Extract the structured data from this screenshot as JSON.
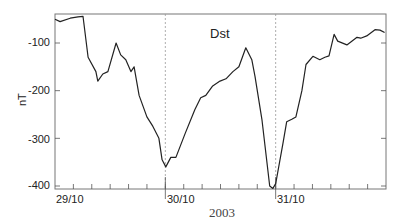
{
  "chart_data": {
    "type": "line",
    "title": "Dst",
    "xlabel": "2003",
    "ylabel": "nT",
    "ylim": [
      -410,
      -40
    ],
    "yticks": [
      -100,
      -200,
      -300,
      -400
    ],
    "ytick_labels": [
      "-100",
      "-200",
      "-300",
      "-400"
    ],
    "xlim_hours": [
      0,
      72
    ],
    "xtick_labels": [
      "29/10",
      "30/10",
      "31/10"
    ],
    "xtick_label_hours": [
      0,
      24,
      48
    ],
    "minor_tick_interval_hours": 4,
    "day_separator_hours": [
      24,
      48
    ],
    "grid": false,
    "legend": null,
    "series": [
      {
        "name": "Dst",
        "color": "#222222",
        "x_hours": [
          0,
          1.1,
          3.3,
          5.0,
          6.1,
          7.2,
          8.9,
          9.3,
          10.4,
          11.5,
          13.3,
          14.3,
          15.4,
          16.5,
          17.2,
          18.3,
          20.0,
          21.3,
          22.6,
          23.3,
          24.1,
          25.2,
          26.3,
          28.3,
          30.4,
          31.7,
          32.8,
          34.3,
          35.9,
          37.2,
          38.7,
          40.0,
          41.5,
          42.8,
          43.5,
          45.0,
          46.7,
          47.4,
          48.0,
          49.6,
          50.4,
          51.5,
          52.4,
          53.7,
          54.6,
          56.1,
          57.6,
          58.7,
          59.6,
          60.7,
          61.5,
          63.5,
          65.7,
          66.5,
          67.8,
          69.6,
          70.7,
          71.7
        ],
        "values": [
          -50,
          -55,
          -48,
          -45,
          -44,
          -130,
          -160,
          -180,
          -165,
          -160,
          -100,
          -125,
          -135,
          -160,
          -150,
          -210,
          -255,
          -275,
          -300,
          -345,
          -360,
          -340,
          -340,
          -290,
          -240,
          -215,
          -210,
          -190,
          -180,
          -175,
          -160,
          -150,
          -110,
          -135,
          -170,
          -260,
          -400,
          -405,
          -395,
          -310,
          -265,
          -260,
          -255,
          -200,
          -145,
          -128,
          -135,
          -130,
          -127,
          -82,
          -96,
          -104,
          -88,
          -90,
          -85,
          -72,
          -73,
          -78
        ]
      }
    ]
  }
}
